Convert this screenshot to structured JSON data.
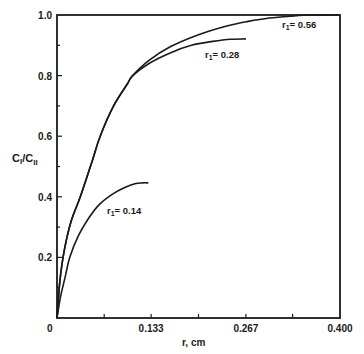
{
  "chart_data": {
    "type": "line",
    "title": "",
    "xlabel": "r, cm",
    "ylabel": "CI/CII",
    "ylabel_parts": {
      "num": "C",
      "num_sub": "I",
      "sep": "/",
      "den": "C",
      "den_sub": "II"
    },
    "xlim": [
      0,
      0.4
    ],
    "ylim": [
      0,
      1.0
    ],
    "grid": false,
    "legend": "inline curve labels",
    "x_ticks": [
      {
        "value": 0,
        "label": "0"
      },
      {
        "value": 0.0667,
        "label": ""
      },
      {
        "value": 0.133,
        "label": "0.133"
      },
      {
        "value": 0.2,
        "label": ""
      },
      {
        "value": 0.267,
        "label": "0.267"
      },
      {
        "value": 0.333,
        "label": ""
      },
      {
        "value": 0.4,
        "label": "0.400"
      }
    ],
    "y_ticks": [
      {
        "value": 0.2,
        "label": "0.2"
      },
      {
        "value": 0.4,
        "label": "0.4"
      },
      {
        "value": 0.6,
        "label": "0.6"
      },
      {
        "value": 0.8,
        "label": "0.8"
      },
      {
        "value": 1.0,
        "label": "1.0"
      },
      {
        "value": 0.1,
        "label": ""
      },
      {
        "value": 0.3,
        "label": ""
      },
      {
        "value": 0.5,
        "label": ""
      },
      {
        "value": 0.7,
        "label": ""
      },
      {
        "value": 0.9,
        "label": ""
      }
    ],
    "series": [
      {
        "name": "r1=0.14",
        "label": "r",
        "label_sub": "1",
        "label_value": "= 0.14",
        "x": [
          0,
          0.005,
          0.012,
          0.018,
          0.03,
          0.045,
          0.06,
          0.079,
          0.095,
          0.11,
          0.12,
          0.129
        ],
        "y": [
          0,
          0.07,
          0.14,
          0.2,
          0.27,
          0.33,
          0.375,
          0.41,
          0.43,
          0.443,
          0.446,
          0.446
        ]
      },
      {
        "name": "r1=0.28",
        "label": "r",
        "label_sub": "1",
        "label_value": "= 0.28",
        "x": [
          0,
          0.004,
          0.01,
          0.02,
          0.033,
          0.05,
          0.061,
          0.08,
          0.1,
          0.107,
          0.13,
          0.16,
          0.19,
          0.22,
          0.245,
          0.267
        ],
        "y": [
          0,
          0.12,
          0.22,
          0.32,
          0.4,
          0.52,
          0.6,
          0.7,
          0.775,
          0.8,
          0.84,
          0.875,
          0.9,
          0.913,
          0.92,
          0.921
        ]
      },
      {
        "name": "r1=0.56",
        "label": "r",
        "label_sub": "1",
        "label_value": "= 0.56",
        "x": [
          0,
          0.004,
          0.01,
          0.02,
          0.033,
          0.05,
          0.061,
          0.08,
          0.1,
          0.107,
          0.13,
          0.16,
          0.2,
          0.24,
          0.27,
          0.3,
          0.33,
          0.36,
          0.4
        ],
        "y": [
          0,
          0.12,
          0.22,
          0.32,
          0.4,
          0.52,
          0.6,
          0.7,
          0.775,
          0.8,
          0.85,
          0.895,
          0.935,
          0.964,
          0.979,
          0.99,
          0.996,
          1.0,
          1.0
        ]
      }
    ]
  },
  "colors": {
    "ink": "#1a1a1a",
    "background": "#ffffff"
  }
}
